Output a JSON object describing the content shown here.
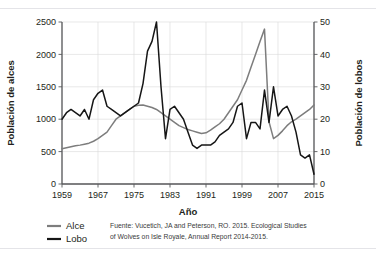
{
  "chart_data": {
    "type": "line",
    "title": "",
    "xlabel": "Año",
    "ylabel": "Población de alces",
    "ylabel_right": "Población de lobos",
    "xlim": [
      1959,
      2015
    ],
    "ylim": [
      0,
      2500
    ],
    "ylim_right": [
      0,
      50
    ],
    "xticks": [
      1959,
      1967,
      1975,
      1983,
      1991,
      1999,
      2007,
      2015
    ],
    "xtick_labels": [
      "1959",
      "1967",
      "1975",
      "1983",
      "1991",
      "1999",
      "2007",
      "2015"
    ],
    "yticks": [
      0,
      500,
      1000,
      1500,
      2000,
      2500
    ],
    "ytick_labels": [
      "0",
      "500",
      "1000",
      "1500",
      "2000",
      "2500"
    ],
    "yticks_right": [
      0,
      10,
      20,
      30,
      40,
      50
    ],
    "ytick_labels_right": [
      "0",
      "10",
      "20",
      "30",
      "40",
      "50"
    ],
    "grid": true,
    "legend_position": "below-left",
    "colors": {
      "moose": "#7d7d7d",
      "wolf": "#161616",
      "axis": "#58595b",
      "grid": "#d9d9d9",
      "background": "#ffffff"
    },
    "x": [
      1959,
      1960,
      1961,
      1962,
      1963,
      1964,
      1965,
      1966,
      1967,
      1968,
      1969,
      1970,
      1971,
      1972,
      1973,
      1974,
      1975,
      1976,
      1977,
      1978,
      1979,
      1980,
      1981,
      1982,
      1983,
      1984,
      1985,
      1986,
      1987,
      1988,
      1989,
      1990,
      1991,
      1992,
      1993,
      1994,
      1995,
      1996,
      1997,
      1998,
      1999,
      2000,
      2001,
      2002,
      2003,
      2004,
      2005,
      2006,
      2007,
      2008,
      2009,
      2010,
      2011,
      2012,
      2013,
      2014,
      2015
    ],
    "series": [
      {
        "name": "Alce",
        "axis": "left",
        "units": "alces",
        "values": [
          545,
          560,
          575,
          590,
          600,
          615,
          630,
          660,
          700,
          750,
          800,
          900,
          1000,
          1050,
          1100,
          1150,
          1200,
          1215,
          1220,
          1200,
          1180,
          1150,
          1100,
          1050,
          1000,
          950,
          900,
          870,
          840,
          820,
          800,
          780,
          790,
          830,
          880,
          930,
          1000,
          1100,
          1200,
          1300,
          1450,
          1600,
          1800,
          2000,
          2200,
          2390,
          960,
          700,
          750,
          820,
          900,
          960,
          1000,
          1050,
          1100,
          1150,
          1220
        ]
      },
      {
        "name": "Lobo",
        "axis": "right",
        "units": "lobos",
        "values": [
          20,
          22,
          23,
          22,
          21,
          23,
          20,
          26,
          28,
          29,
          24,
          23,
          22,
          21,
          22,
          23,
          24,
          25,
          31,
          41,
          44,
          50,
          30,
          14,
          23,
          24,
          22,
          20,
          16,
          12,
          11,
          12,
          12,
          12,
          13,
          15,
          16,
          17,
          19,
          24,
          25,
          14,
          19,
          19,
          17,
          29,
          19,
          30,
          21,
          23,
          24,
          21,
          16,
          9,
          8,
          9,
          3
        ]
      }
    ],
    "annotations": {
      "source": "Fuente: Vucetich, JA and Peterson, RO. 2015. Ecological Studies of Wolves on Isle Royale, Annual Report 2014-2015.",
      "source_line1": "Fuente: Vucetich, JA and Peterson, RO. 2015. Ecological Studies",
      "source_line2": "of Wolves on Isle Royale, Annual Report 2014-2015."
    },
    "legend": [
      {
        "label": "Alce",
        "color": "#7d7d7d"
      },
      {
        "label": "Lobo",
        "color": "#161616"
      }
    ]
  }
}
